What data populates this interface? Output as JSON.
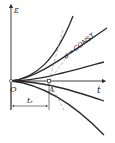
{
  "diagram": {
    "axes": {
      "y_label": "ε",
      "x_label": "t",
      "origin_label": "O"
    },
    "annotations": {
      "curve_label": "σ̇ = CONST.",
      "point_label": "A",
      "interval_label": "t_r",
      "interval_text": "tᵣ"
    },
    "colors": {
      "line": "#2a2a2a",
      "dashed": "#888888",
      "background": "#ffffff"
    },
    "curves_count": 5
  }
}
